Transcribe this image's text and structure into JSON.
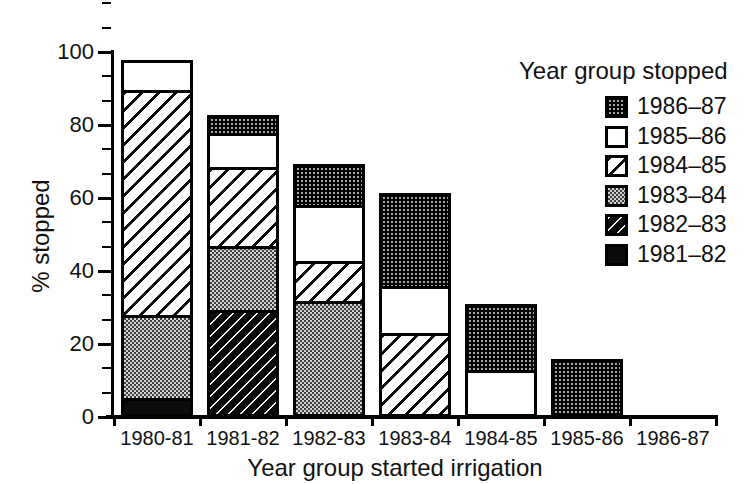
{
  "chart_data": {
    "type": "bar",
    "stacked": true,
    "title": "",
    "xlabel": "Year group started irrigation",
    "ylabel": "% stopped",
    "ylim": [
      0,
      100
    ],
    "y_major_ticks": [
      0,
      20,
      40,
      60,
      80,
      100
    ],
    "y_minor_divisions_per_major": 3,
    "grid": false,
    "categories": [
      "1980-81",
      "1981-82",
      "1982-83",
      "1983-84",
      "1984-85",
      "1985-86",
      "1986-87"
    ],
    "series": [
      {
        "name": "1981–82",
        "pattern": "solid-black",
        "values": [
          4,
          0,
          0,
          0,
          0,
          0,
          0
        ]
      },
      {
        "name": "1982–83",
        "pattern": "dark-diagonal",
        "values": [
          0,
          28.5,
          0,
          0,
          0,
          0,
          0
        ]
      },
      {
        "name": "1983–84",
        "pattern": "gray-checker",
        "values": [
          23,
          17.5,
          31,
          0,
          0,
          0,
          0
        ]
      },
      {
        "name": "1984–85",
        "pattern": "light-diagonal",
        "values": [
          62,
          22,
          11,
          22,
          0,
          0,
          0
        ]
      },
      {
        "name": "1985–86",
        "pattern": "white",
        "values": [
          8,
          9.5,
          15.5,
          13,
          12,
          0,
          0
        ]
      },
      {
        "name": "1986–87",
        "pattern": "dark-dotted",
        "values": [
          0,
          4.5,
          11,
          25.5,
          18,
          15,
          0
        ]
      }
    ],
    "stack_totals": [
      97,
      82,
      68.5,
      60.5,
      30,
      15,
      0
    ],
    "legend_title": "Year group stopped",
    "legend_position": "top-right",
    "legend_items": [
      {
        "label": "1986–87",
        "pattern": "dark-dotted"
      },
      {
        "label": "1985–86",
        "pattern": "white"
      },
      {
        "label": "1984–85",
        "pattern": "light-diagonal"
      },
      {
        "label": "1983–84",
        "pattern": "gray-checker"
      },
      {
        "label": "1982–83",
        "pattern": "dark-diagonal"
      },
      {
        "label": "1981–82",
        "pattern": "solid-black"
      }
    ]
  }
}
